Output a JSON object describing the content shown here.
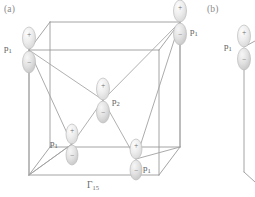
{
  "figure": {
    "panels": [
      {
        "id": "a",
        "label": "(a)",
        "caption": "Γ₁₅"
      },
      {
        "id": "b",
        "label": "(b)",
        "caption": ""
      }
    ],
    "symmetry_label": "Γ",
    "symmetry_sub": "15",
    "colors": {
      "line": "#9a9a9a",
      "line_dark": "#8a8a8a",
      "orbital_fill": "#e8e8e8",
      "orbital_stroke": "#b9b9b9",
      "text": "#5a5a5a",
      "panel_text": "#8a8a8a",
      "background": "#ffffff"
    },
    "sign_positive": "+",
    "sign_negative": "−",
    "orbitals": [
      {
        "id": "o1",
        "name": "p",
        "sub": "1",
        "label_side": "right",
        "x": 29,
        "y": 50,
        "plus": "+",
        "minus": "−",
        "panel": "a"
      },
      {
        "id": "o2",
        "name": "p",
        "sub": "1",
        "label_side": "right",
        "x": 180,
        "y": 22,
        "plus": "+",
        "minus": "−",
        "panel": "a"
      },
      {
        "id": "o3",
        "name": "p",
        "sub": "2",
        "label_side": "right",
        "x": 103,
        "y": 100,
        "plus": "+",
        "minus": "−",
        "panel": "a"
      },
      {
        "id": "o4",
        "name": "p",
        "sub": "1",
        "label_side": "left",
        "x": 72,
        "y": 144,
        "plus": "+",
        "minus": "−",
        "panel": "a"
      },
      {
        "id": "o5",
        "name": "p",
        "sub": "1",
        "label_side": "right",
        "x": 136,
        "y": 159,
        "plus": "+",
        "minus": "−",
        "panel": "a"
      },
      {
        "id": "o6",
        "name": "p",
        "sub": "1",
        "label_side": "left",
        "x": 244,
        "y": 47,
        "plus": "+",
        "minus": "−",
        "panel": "b"
      }
    ],
    "labels": {
      "p1": "p",
      "p1_sub": "1",
      "p2": "p",
      "p2_sub": "2"
    }
  }
}
